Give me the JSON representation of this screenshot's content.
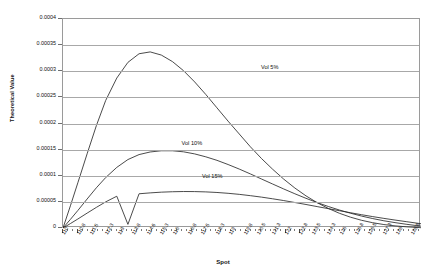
{
  "chart_data": {
    "type": "line",
    "title": "",
    "xlabel": "Spot",
    "ylabel": "Theoretical Value",
    "xlim": [
      110,
      129.3
    ],
    "ylim": [
      0,
      0.0004
    ],
    "grid": true,
    "legend_position": "inline-annotations",
    "y_ticks": [
      0,
      5e-05,
      0.0001,
      0.00015,
      0.0002,
      0.00025,
      0.0003,
      0.00035,
      0.0004
    ],
    "y_tick_labels": [
      "0",
      "0.00005",
      "0.0001",
      "0.00015",
      "0.0002",
      "0.00025",
      "0.0003",
      "0.00035",
      "0.0004"
    ],
    "x_ticks": [
      110,
      110.8,
      111.5,
      112.3,
      113,
      113.8,
      114.6,
      115.3,
      116,
      116.8,
      117.5,
      118.3,
      119,
      119.8,
      120.5,
      121.3,
      122,
      122.8,
      123.5,
      124.3,
      125,
      125.8,
      126.5,
      127.3,
      128,
      128.8,
      129.5
    ],
    "x_tick_labels": [
      "110",
      "110.8",
      "111.5",
      "112.3",
      "113",
      "113.8",
      "114.6",
      "115.3",
      "116",
      "116.8",
      "117.5",
      "118.3",
      "119",
      "119.8",
      "120.5",
      "121.3",
      "122",
      "122.8",
      "123.5",
      "124.3",
      "125",
      "125.8",
      "126.5",
      "127.3",
      "128",
      "128.8",
      "129.5"
    ],
    "series": [
      {
        "name": "Vol 5%",
        "label": "Vol 5%",
        "color": "#2b2b2b",
        "annotation": {
          "x": 121.2,
          "y": 0.000307
        },
        "x": [
          110,
          110.4,
          110.8,
          111.3,
          111.8,
          112.3,
          112.9,
          113.5,
          114.1,
          114.7,
          115.3,
          115.9,
          116.5,
          117.1,
          117.7,
          118.3,
          118.9,
          119.5,
          120.1,
          120.7,
          121.3,
          121.9,
          122.5,
          123.1,
          123.7,
          124.3,
          124.9,
          125.5,
          126.1,
          126.7,
          127.3,
          127.9,
          128.5,
          129.3
        ],
        "y": [
          0.0,
          4.25e-05,
          8.65e-05,
          0.000142,
          0.000196,
          0.000244,
          0.000287,
          0.000317,
          0.0003335,
          0.000337,
          0.000331,
          0.0003185,
          0.000301,
          0.0002795,
          0.0002555,
          0.00023,
          0.0002045,
          0.00018,
          0.0001555,
          0.000133,
          0.0001125,
          9.35e-05,
          7.65e-05,
          6.15e-05,
          4.85e-05,
          3.75e-05,
          2.82e-05,
          2.07e-05,
          1.47e-05,
          1.01e-05,
          6.6e-06,
          4.1e-06,
          2.3e-06,
          6e-07
        ]
      },
      {
        "name": "Vol 10%",
        "label": "Vol 10%",
        "color": "#2b2b2b",
        "annotation": {
          "x": 117.0,
          "y": 0.000161
        },
        "x": [
          110,
          110.4,
          110.8,
          111.3,
          111.8,
          112.3,
          112.9,
          113.5,
          114.1,
          114.7,
          115.3,
          115.9,
          116.5,
          117.1,
          117.7,
          118.3,
          118.9,
          119.5,
          120.1,
          120.7,
          121.3,
          121.9,
          122.5,
          123.1,
          123.7,
          124.3,
          124.9,
          125.5,
          126.1,
          126.7,
          127.3,
          127.9,
          128.5,
          129.3
        ],
        "y": [
          0.0,
          1.65e-05,
          3.35e-05,
          5.55e-05,
          7.7e-05,
          9.65e-05,
          0.000116,
          0.000131,
          0.0001405,
          0.0001455,
          0.0001478,
          0.0001478,
          0.0001458,
          0.0001418,
          0.0001362,
          0.0001295,
          0.0001215,
          0.0001128,
          0.0001035,
          9.38e-05,
          8.42e-05,
          7.47e-05,
          6.55e-05,
          5.68e-05,
          4.87e-05,
          4.12e-05,
          3.44e-05,
          2.83e-05,
          2.28e-05,
          1.8e-05,
          1.38e-05,
          1.03e-05,
          7.2e-06,
          3.5e-06
        ]
      },
      {
        "name": "Vol 15%",
        "label": "Vol 15%",
        "color": "#2b2b2b",
        "annotation": {
          "x": 118.1,
          "y": 9.75e-05
        },
        "x": [
          110,
          110.4,
          110.8,
          111.3,
          111.8,
          112.3,
          112.9,
          113.5,
          114.1,
          114.7,
          115.3,
          115.9,
          116.5,
          117.1,
          117.7,
          118.3,
          118.9,
          119.5,
          120.1,
          120.7,
          121.3,
          121.9,
          122.5,
          123.1,
          123.7,
          124.3,
          124.9,
          125.5,
          126.1,
          126.7,
          127.3,
          127.9,
          128.5,
          129.3
        ],
        "y": [
          0.0,
          8.5e-06,
          1.72e-05,
          2.85e-05,
          3.95e-05,
          5e-05,
          6.08e-05,
          6.95e-06,
          6.55e-05,
          6.72e-05,
          6.86e-05,
          6.94e-05,
          6.98e-05,
          6.97e-05,
          6.91e-05,
          6.8e-05,
          6.64e-05,
          6.44e-05,
          6.19e-05,
          5.91e-05,
          5.59e-05,
          5.25e-05,
          4.88e-05,
          4.5e-05,
          4.1e-05,
          3.7e-05,
          3.31e-05,
          2.92e-05,
          2.54e-05,
          2.18e-05,
          1.84e-05,
          1.52e-05,
          1.22e-05,
          8.2e-06
        ]
      }
    ]
  }
}
